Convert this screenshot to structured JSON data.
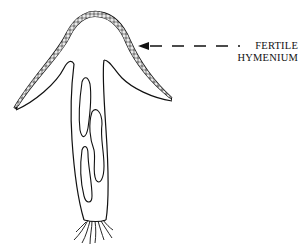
{
  "diagram": {
    "top_fragment_text": "· · ·  ·  ·  · · · · ·",
    "labels": {
      "line1": "FERTILE",
      "line2": "HYMENIUM"
    },
    "parts": [
      "cap",
      "fertile-hymenium-layer",
      "hollow-stalk",
      "internal-cavities",
      "rhizoids"
    ],
    "colors": {
      "ink": "#111111",
      "background": "#ffffff"
    }
  }
}
